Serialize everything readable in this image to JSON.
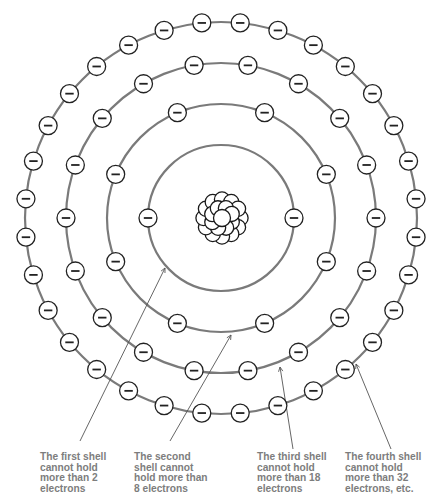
{
  "diagram": {
    "center": {
      "x": 221,
      "y": 218
    },
    "colors": {
      "ring": "#7a7a7a",
      "electron_stroke": "#222222",
      "label_text": "#7d7d7d",
      "background": "#ffffff"
    },
    "electron_symbol": "minus-sign",
    "electron_radius": 9,
    "shells": [
      {
        "name": "first-shell",
        "radius": 73,
        "electron_count": 2,
        "angle_offset_deg": 90
      },
      {
        "name": "second-shell",
        "radius": 114,
        "electron_count": 8,
        "angle_offset_deg": 22.5
      },
      {
        "name": "third-shell",
        "radius": 155,
        "electron_count": 18,
        "angle_offset_deg": 10
      },
      {
        "name": "fourth-shell",
        "radius": 196,
        "electron_count": 32,
        "angle_offset_deg": 5.625
      }
    ],
    "nucleus": {
      "radius": 25,
      "particle": "proton-neutron-cluster"
    }
  },
  "labels": [
    {
      "name": "first-shell-label",
      "x": 40,
      "y": 452,
      "lines": [
        "The first shell",
        "cannot hold",
        "more than 2",
        "electrons"
      ],
      "leader": {
        "x1": 80,
        "y1": 441,
        "x2": 165,
        "y2": 268
      }
    },
    {
      "name": "second-shell-label",
      "x": 134,
      "y": 452,
      "lines": [
        "The second",
        "shell cannot",
        "hold more than",
        "8 electrons"
      ],
      "leader": {
        "x1": 170,
        "y1": 441,
        "x2": 231,
        "y2": 335
      }
    },
    {
      "name": "third-shell-label",
      "x": 257,
      "y": 452,
      "lines": [
        "The third shell",
        "cannot hold",
        "more than 18",
        "electrons"
      ],
      "leader": {
        "x1": 293,
        "y1": 449,
        "x2": 280,
        "y2": 367
      }
    },
    {
      "name": "fourth-shell-label",
      "x": 345,
      "y": 452,
      "lines": [
        "The fourth shell",
        "cannot hold",
        "more than 32",
        "electrons, etc."
      ],
      "leader": {
        "x1": 391,
        "y1": 449,
        "x2": 356,
        "y2": 364
      }
    }
  ]
}
